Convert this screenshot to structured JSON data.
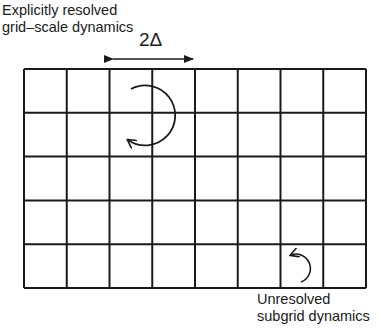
{
  "labels": {
    "resolved_line1": "Explicitly resolved",
    "resolved_line2": "grid–scale dynamics",
    "unresolved_line1": "Unresolved",
    "unresolved_line2": "subgrid dynamics",
    "scale": "2Δ"
  },
  "grid": {
    "columns": 8,
    "rows": 5,
    "left": 24,
    "top": 69,
    "right": 366,
    "bottom": 288,
    "line_color": "#1a1a1a"
  },
  "annotations": {
    "scale_arrow": {
      "x1": 110,
      "x2": 196,
      "y": 59
    },
    "large_eddy": {
      "cx": 150,
      "cy": 113,
      "r": 30
    },
    "small_eddy": {
      "cx": 302,
      "cy": 267,
      "r": 14
    }
  }
}
